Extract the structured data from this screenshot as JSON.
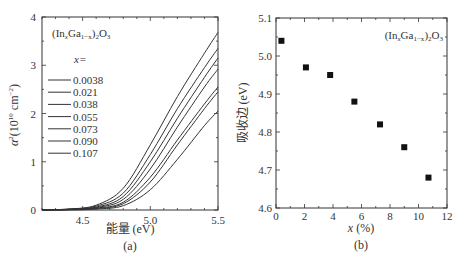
{
  "chart_data": [
    {
      "type": "line",
      "panel_label": "(a)",
      "title": "",
      "annotation": "(In_xGa_{1-x})_2O_3",
      "xlabel": "能量 (eV)",
      "ylabel": "α²(10¹⁰ cm⁻²)",
      "xlim": [
        4.2,
        5.5
      ],
      "ylim": [
        0,
        4
      ],
      "xticks": [
        "4.5",
        "5.0",
        "5.5"
      ],
      "yticks": [
        "0",
        "1",
        "2",
        "3",
        "4"
      ],
      "grid": false,
      "legend_title": "x=",
      "legend_position": "upper-left",
      "series": [
        {
          "name": "0.0038",
          "x": [
            4.2,
            4.4,
            4.6,
            4.8,
            5.0,
            5.2,
            5.4,
            5.5
          ],
          "values": [
            0.0,
            0.02,
            0.1,
            0.45,
            1.35,
            2.35,
            3.25,
            3.68
          ]
        },
        {
          "name": "0.021",
          "x": [
            4.2,
            4.4,
            4.6,
            4.8,
            5.0,
            5.2,
            5.4,
            5.5
          ],
          "values": [
            0.0,
            0.02,
            0.08,
            0.35,
            1.15,
            2.1,
            2.95,
            3.35
          ]
        },
        {
          "name": "0.038",
          "x": [
            4.2,
            4.4,
            4.6,
            4.8,
            5.0,
            5.2,
            5.4,
            5.5
          ],
          "values": [
            0.0,
            0.01,
            0.06,
            0.28,
            1.0,
            1.9,
            2.75,
            3.15
          ]
        },
        {
          "name": "0.055",
          "x": [
            4.2,
            4.4,
            4.6,
            4.8,
            5.0,
            5.2,
            5.4,
            5.5
          ],
          "values": [
            0.0,
            0.01,
            0.05,
            0.22,
            0.85,
            1.72,
            2.55,
            2.92
          ]
        },
        {
          "name": "0.073",
          "x": [
            4.2,
            4.4,
            4.6,
            4.8,
            5.0,
            5.2,
            5.4,
            5.5
          ],
          "values": [
            0.0,
            0.01,
            0.04,
            0.16,
            0.68,
            1.45,
            2.2,
            2.55
          ]
        },
        {
          "name": "0.090",
          "x": [
            4.2,
            4.4,
            4.6,
            4.8,
            5.0,
            5.2,
            5.4,
            5.5
          ],
          "values": [
            0.0,
            0.01,
            0.03,
            0.13,
            0.58,
            1.35,
            2.1,
            2.45
          ]
        },
        {
          "name": "0.107",
          "x": [
            4.2,
            4.4,
            4.6,
            4.8,
            5.0,
            5.2,
            5.4,
            5.5
          ],
          "values": [
            0.0,
            0.0,
            0.02,
            0.09,
            0.42,
            1.05,
            1.75,
            2.05
          ]
        }
      ]
    },
    {
      "type": "scatter",
      "panel_label": "(b)",
      "title": "",
      "annotation": "(In_xGa_{1-x})_2O_3",
      "xlabel": "x (%)",
      "ylabel": "吸收边 (eV)",
      "xlim": [
        0,
        12
      ],
      "ylim": [
        4.6,
        5.1
      ],
      "xticks": [
        "0",
        "2",
        "4",
        "6",
        "8",
        "10",
        "12"
      ],
      "yticks": [
        "4.6",
        "4.7",
        "4.8",
        "4.9",
        "5.0",
        "5.1"
      ],
      "grid": false,
      "series": [
        {
          "name": "absorption edge",
          "x": [
            0.38,
            2.1,
            3.8,
            5.5,
            7.3,
            9.0,
            10.7
          ],
          "values": [
            5.04,
            4.97,
            4.95,
            4.88,
            4.82,
            4.76,
            4.68
          ]
        }
      ]
    }
  ],
  "labels": {
    "a_panel": "(a)",
    "b_panel": "(b)",
    "a_xlabel": "能量 (eV)",
    "b_xlabel_var": "x",
    "b_xlabel_unit": "(%)",
    "b_ylabel": "吸收边 (eV)",
    "legend_title": "x="
  }
}
